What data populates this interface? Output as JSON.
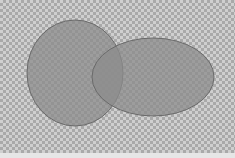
{
  "diagram": {
    "type": "venn",
    "shapes": [
      {
        "id": "left-circle",
        "cx": 75,
        "cy": 73,
        "rx": 48,
        "ry": 53,
        "fill": "#8c8c8c",
        "stroke": "#6a6a6a",
        "opacity": 0.75
      },
      {
        "id": "right-ellipse",
        "cx": 153,
        "cy": 77,
        "rx": 61,
        "ry": 39,
        "fill": "#8c8c8c",
        "stroke": "#6a6a6a",
        "opacity": 0.75
      }
    ],
    "background": "transparency-checkerboard"
  }
}
